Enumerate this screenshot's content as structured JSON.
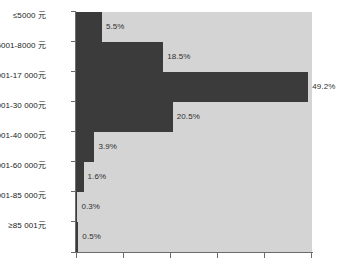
{
  "chart_data": {
    "type": "bar",
    "orientation": "horizontal",
    "title": "",
    "xlabel": "",
    "ylabel": "",
    "xlim": [
      0,
      50
    ],
    "grid": false,
    "legend": null,
    "x_tick_labels": [],
    "categories": [
      "≤5000 元",
      "5001-8000 元",
      "8001-17 000元",
      "17 001-30 000元",
      "30 001-40 000元",
      "40 001-60 000元",
      "60 001-85 000元",
      "≥85 001元"
    ],
    "values": [
      5.5,
      18.5,
      49.2,
      20.5,
      3.9,
      1.6,
      0.3,
      0.5
    ],
    "value_labels": [
      "5.5%",
      "18.5%",
      "49.2%",
      "20.5%",
      "3.9%",
      "1.6%",
      "0.3%",
      "0.5%"
    ],
    "colors": {
      "bar": "#3b3b3b",
      "track": "#d4d4d4",
      "axis": "#6b6b6b",
      "label_text": "#1a1a1a",
      "value_text": "#2f2f2f",
      "background": "#ffffff"
    }
  }
}
